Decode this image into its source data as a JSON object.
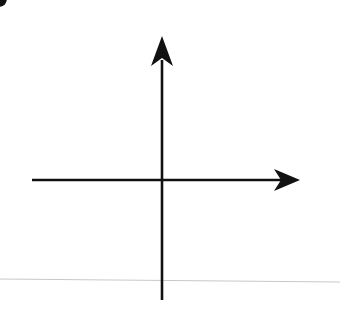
{
  "chart_data": {
    "type": "line",
    "title": "",
    "xlabel": "x",
    "ylabel": "f(x)",
    "xlim": [
      -5,
      5
    ],
    "ylim": [
      -5,
      5
    ],
    "grid": true,
    "grid_step": 1,
    "tick_labels": {
      "x": [
        "-5",
        "5"
      ],
      "y": [
        "5",
        "-5"
      ]
    },
    "series": [
      {
        "name": "f(x)",
        "shape": "upper half-ellipse arc",
        "x": [
          -5,
          -4,
          -3,
          -2,
          -1,
          0,
          1,
          2,
          3,
          4,
          5
        ],
        "values": [
          0.5,
          2.0,
          2.5,
          2.8,
          2.95,
          3.0,
          2.95,
          2.8,
          2.5,
          2.0,
          0.5
        ],
        "endpoints": [
          {
            "x": -5,
            "y": 0.5,
            "closed": true
          },
          {
            "x": 5,
            "y": 0.5,
            "closed": true
          }
        ]
      }
    ]
  },
  "labels": {
    "y_axis_title": "f(x)",
    "x_axis_title": "x",
    "y_top_tick": "5",
    "y_bottom_tick": "- 5",
    "x_left_tick": "- 5",
    "x_right_tick": "5"
  }
}
